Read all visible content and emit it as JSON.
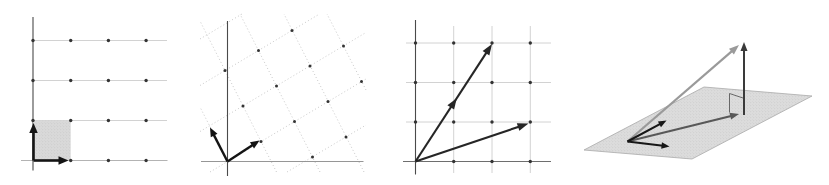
{
  "canvas": {
    "width": 829,
    "height": 185,
    "background": "#ffffff"
  },
  "palette": {
    "grid_light": "#c6c6c6",
    "axis_dark": "#4a4a4a",
    "axis_medium": "#8a8a8a",
    "dotted_grid": "#b5b5b5",
    "lattice_dot": "#333333",
    "vector_black": "#141414",
    "vector_gray": "#9a9a9a",
    "vector_darkgray": "#585858",
    "vector_vertical": "#3a3a3a",
    "shade_fill": "#d9d9d9",
    "plane_fill": "#dcdcdc",
    "plane_stroke": "#a8a8a8"
  },
  "panels": [
    {
      "name": "panel-unit-grid-standard-basis",
      "elements": [
        {
          "type": "line",
          "name": "grid-hline",
          "x1": 33,
          "y1": 40.5,
          "x2": 167,
          "y2": 40.5,
          "color": "#c6c6c6",
          "width": 0.8
        },
        {
          "type": "line",
          "name": "grid-hline",
          "x1": 33,
          "y1": 80.5,
          "x2": 167,
          "y2": 80.5,
          "color": "#c6c6c6",
          "width": 0.8
        },
        {
          "type": "line",
          "name": "grid-hline",
          "x1": 33,
          "y1": 120.5,
          "x2": 167,
          "y2": 120.5,
          "color": "#c6c6c6",
          "width": 0.8
        },
        {
          "type": "line",
          "name": "x-axis-line",
          "x1": 21,
          "y1": 160.5,
          "x2": 167.5,
          "y2": 160.5,
          "color": "#aaaaaa",
          "width": 0.9
        },
        {
          "type": "line",
          "name": "y-axis-line",
          "x1": 33,
          "y1": 17,
          "x2": 33,
          "y2": 170.5,
          "color": "#4a4a4a",
          "width": 1.1
        },
        {
          "type": "poly",
          "name": "unit-square-shading",
          "pts": [
            [
              33,
              120.5
            ],
            [
              70.7,
              120.5
            ],
            [
              70.7,
              160.5
            ],
            [
              33,
              160.5
            ]
          ],
          "fill": "#d9d9d9",
          "stroke": "none",
          "stroke_width": 0,
          "stipple": true
        },
        {
          "type": "dots",
          "name": "lattice-dot",
          "r": 1.7,
          "color": "#333333",
          "pts": [
            [
              33,
              40.5
            ],
            [
              70.7,
              40.5
            ],
            [
              108.4,
              40.5
            ],
            [
              146.1,
              40.5
            ],
            [
              33,
              80.5
            ],
            [
              70.7,
              80.5
            ],
            [
              108.4,
              80.5
            ],
            [
              146.1,
              80.5
            ],
            [
              33,
              120.5
            ],
            [
              70.7,
              120.5
            ],
            [
              108.4,
              120.5
            ],
            [
              146.1,
              120.5
            ],
            [
              70.7,
              160.5
            ],
            [
              108.4,
              160.5
            ],
            [
              146.1,
              160.5
            ]
          ]
        },
        {
          "type": "arrow",
          "name": "basis-vector-e2",
          "x1": 33.5,
          "y1": 160.5,
          "x2": 33.5,
          "y2": 123,
          "color": "#141414",
          "width": 2.6,
          "head_l": 10,
          "head_w": 8.5
        },
        {
          "type": "arrow",
          "name": "basis-vector-e1",
          "x1": 33.5,
          "y1": 160.5,
          "x2": 68.5,
          "y2": 160.5,
          "color": "#141414",
          "width": 2.6,
          "head_l": 10,
          "head_w": 8.5
        }
      ]
    },
    {
      "name": "panel-skewed-lattice-basis",
      "elements": [
        {
          "type": "line",
          "name": "dotted-lattice-line",
          "x1": 200,
          "y1": 39,
          "x2": 242,
          "y2": 14,
          "color": "#b5b5b5",
          "width": 0.75,
          "dash": "1 2.4"
        },
        {
          "type": "line",
          "name": "dotted-lattice-line",
          "x1": 200,
          "y1": 85.5,
          "x2": 319.5,
          "y2": 14,
          "color": "#b5b5b5",
          "width": 0.75,
          "dash": "1 2.4"
        },
        {
          "type": "line",
          "name": "dotted-lattice-line",
          "x1": 200,
          "y1": 131.5,
          "x2": 366,
          "y2": 32.5,
          "color": "#b5b5b5",
          "width": 0.75,
          "dash": "1 2.4"
        },
        {
          "type": "line",
          "name": "dotted-lattice-line",
          "x1": 210,
          "y1": 172,
          "x2": 366,
          "y2": 79,
          "color": "#b5b5b5",
          "width": 0.75,
          "dash": "1 2.4"
        },
        {
          "type": "line",
          "name": "dotted-lattice-line",
          "x1": 287,
          "y1": 172,
          "x2": 366,
          "y2": 125,
          "color": "#b5b5b5",
          "width": 0.75,
          "dash": "1 2.4"
        },
        {
          "type": "line",
          "name": "dotted-lattice-line",
          "x1": 224.5,
          "y1": 155,
          "x2": 200.5,
          "y2": 108,
          "color": "#b5b5b5",
          "width": 0.75,
          "dash": "1 2.4"
        },
        {
          "type": "line",
          "name": "dotted-lattice-line",
          "x1": 276.5,
          "y1": 172,
          "x2": 200,
          "y2": 21,
          "color": "#b5b5b5",
          "width": 0.75,
          "dash": "1 2.4"
        },
        {
          "type": "line",
          "name": "dotted-lattice-line",
          "x1": 320,
          "y1": 172,
          "x2": 240,
          "y2": 14,
          "color": "#b5b5b5",
          "width": 0.75,
          "dash": "1 2.4"
        },
        {
          "type": "line",
          "name": "dotted-lattice-line",
          "x1": 364,
          "y1": 172,
          "x2": 284,
          "y2": 14,
          "color": "#b5b5b5",
          "width": 0.75,
          "dash": "1 2.4"
        },
        {
          "type": "line",
          "name": "dotted-lattice-line",
          "x1": 366,
          "y1": 90,
          "x2": 327,
          "y2": 14,
          "color": "#b5b5b5",
          "width": 0.75,
          "dash": "1 2.4"
        },
        {
          "type": "line",
          "name": "y-axis-line",
          "x1": 227.5,
          "y1": 21,
          "x2": 227.5,
          "y2": 176,
          "color": "#4a4a4a",
          "width": 1.1
        },
        {
          "type": "line",
          "name": "x-axis-line",
          "x1": 201,
          "y1": 161.5,
          "x2": 363.5,
          "y2": 161.5,
          "color": "#8a8a8a",
          "width": 0.9
        },
        {
          "type": "dots",
          "name": "lattice-dot",
          "r": 1.5,
          "color": "#333333",
          "pts": [
            [
              261,
              141.5
            ],
            [
              294.5,
              121.5
            ],
            [
              328,
              101.5
            ],
            [
              361.5,
              81.5
            ],
            [
              243,
              106
            ],
            [
              276.5,
              86
            ],
            [
              310,
              66
            ],
            [
              343.5,
              46
            ],
            [
              225,
              70.5
            ],
            [
              258.5,
              50.5
            ],
            [
              292,
              30.5
            ],
            [
              312.5,
              157
            ],
            [
              346,
              137
            ]
          ]
        },
        {
          "type": "arrow",
          "name": "basis-vector-v",
          "x1": 227.5,
          "y1": 161.5,
          "x2": 210,
          "y2": 127.5,
          "color": "#141414",
          "width": 2.4,
          "head_l": 9,
          "head_w": 7.5
        },
        {
          "type": "arrow",
          "name": "basis-vector-u",
          "x1": 227.5,
          "y1": 161.5,
          "x2": 259.5,
          "y2": 140.5,
          "color": "#141414",
          "width": 2.4,
          "head_l": 9,
          "head_w": 7.5
        }
      ]
    },
    {
      "name": "panel-two-vectors-on-grid",
      "elements": [
        {
          "type": "line",
          "name": "grid-vline",
          "x1": 453.7,
          "y1": 26,
          "x2": 453.7,
          "y2": 173,
          "color": "#c6c6c6",
          "width": 0.8
        },
        {
          "type": "line",
          "name": "grid-vline",
          "x1": 492,
          "y1": 26,
          "x2": 492,
          "y2": 173,
          "color": "#c6c6c6",
          "width": 0.8
        },
        {
          "type": "line",
          "name": "grid-vline",
          "x1": 530.3,
          "y1": 26,
          "x2": 530.3,
          "y2": 173,
          "color": "#c6c6c6",
          "width": 0.8
        },
        {
          "type": "line",
          "name": "grid-hline",
          "x1": 406,
          "y1": 43,
          "x2": 551,
          "y2": 43,
          "color": "#c6c6c6",
          "width": 0.8
        },
        {
          "type": "line",
          "name": "grid-hline",
          "x1": 406,
          "y1": 82.5,
          "x2": 551,
          "y2": 82.5,
          "color": "#c6c6c6",
          "width": 0.8
        },
        {
          "type": "line",
          "name": "grid-hline",
          "x1": 406,
          "y1": 122,
          "x2": 551,
          "y2": 122,
          "color": "#c6c6c6",
          "width": 0.8
        },
        {
          "type": "line",
          "name": "y-axis-line",
          "x1": 415.5,
          "y1": 20,
          "x2": 415.5,
          "y2": 174.5,
          "color": "#4a4a4a",
          "width": 1.1
        },
        {
          "type": "line",
          "name": "x-axis-line",
          "x1": 403,
          "y1": 161.5,
          "x2": 551,
          "y2": 161.5,
          "color": "#6e6e6e",
          "width": 1
        },
        {
          "type": "dots",
          "name": "lattice-dot",
          "r": 1.7,
          "color": "#333333",
          "pts": [
            [
              415.5,
              43
            ],
            [
              453.7,
              43
            ],
            [
              492,
              43
            ],
            [
              530.3,
              43
            ],
            [
              415.5,
              82.5
            ],
            [
              453.7,
              82.5
            ],
            [
              492,
              82.5
            ],
            [
              530.3,
              82.5
            ],
            [
              415.5,
              122
            ],
            [
              453.7,
              122
            ],
            [
              492,
              122
            ],
            [
              530.3,
              122
            ],
            [
              453.7,
              161.5
            ],
            [
              492,
              161.5
            ],
            [
              530.3,
              161.5
            ]
          ]
        },
        {
          "type": "arrow",
          "name": "vector-2-3-with-midpoint-head",
          "x1": 415.5,
          "y1": 161.5,
          "x2": 492,
          "y2": 44,
          "color": "#262626",
          "width": 2.1,
          "head_l": 11,
          "head_w": 8,
          "mids": [
            0.5
          ]
        },
        {
          "type": "arrow",
          "name": "vector-3-1",
          "x1": 415.5,
          "y1": 161.5,
          "x2": 528.5,
          "y2": 123.5,
          "color": "#262626",
          "width": 2.1,
          "head_l": 11,
          "head_w": 8
        }
      ]
    },
    {
      "name": "panel-plane-projection-3d",
      "elements": [
        {
          "type": "poly",
          "name": "plane-parallelogram",
          "pts": [
            [
              584,
              150
            ],
            [
              704,
              87
            ],
            [
              812,
              96
            ],
            [
              692,
              159
            ]
          ],
          "fill": "#dcdcdc",
          "stroke": "#a8a8a8",
          "stroke_width": 0.8,
          "stipple": true
        },
        {
          "type": "pline",
          "name": "right-angle-marker",
          "pts": [
            [
              729.5,
              112.5
            ],
            [
              729.5,
              93.5
            ],
            [
              743,
              98
            ]
          ],
          "color": "#5a5a5a",
          "width": 0.9
        },
        {
          "type": "arrow",
          "name": "vector-v-out-of-plane",
          "x1": 627.5,
          "y1": 141.5,
          "x2": 739,
          "y2": 45,
          "color": "#9a9a9a",
          "width": 2.2,
          "head_l": 10,
          "head_w": 7.5
        },
        {
          "type": "arrow",
          "name": "projection-onto-plane",
          "x1": 627.5,
          "y1": 141.5,
          "x2": 739,
          "y2": 114,
          "color": "#585858",
          "width": 2,
          "head_l": 9,
          "head_w": 7
        },
        {
          "type": "arrow",
          "name": "orthogonal-component",
          "x1": 744,
          "y1": 115,
          "x2": 744,
          "y2": 42,
          "color": "#3a3a3a",
          "width": 2,
          "head_l": 9,
          "head_w": 7
        },
        {
          "type": "arrow",
          "name": "plane-basis-vector-1",
          "x1": 627.5,
          "y1": 141.5,
          "x2": 666.5,
          "y2": 120.5,
          "color": "#171717",
          "width": 2.1,
          "head_l": 8,
          "head_w": 6.5
        },
        {
          "type": "arrow",
          "name": "plane-basis-vector-2",
          "x1": 627.5,
          "y1": 141.5,
          "x2": 669.5,
          "y2": 146.5,
          "color": "#171717",
          "width": 2.1,
          "head_l": 8,
          "head_w": 6.5
        }
      ]
    }
  ]
}
